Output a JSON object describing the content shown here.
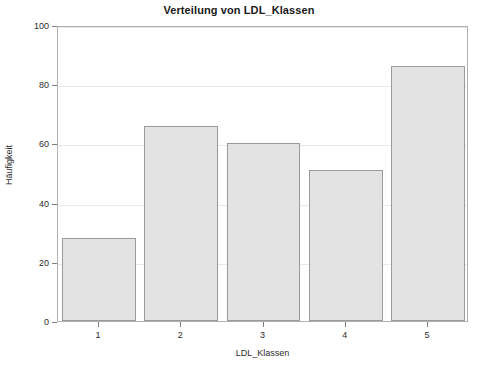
{
  "chart_data": {
    "type": "bar",
    "title": "Verteilung von LDL_Klassen",
    "xlabel": "LDL_Klassen",
    "ylabel": "Häufigkeit",
    "categories": [
      "1",
      "2",
      "3",
      "4",
      "5"
    ],
    "values": [
      28,
      66,
      60,
      51,
      86
    ],
    "ylim": [
      0,
      100
    ],
    "yticks": [
      0,
      20,
      40,
      60,
      80,
      100
    ],
    "ytick_labels": [
      "0",
      "20",
      "40",
      "60",
      "80",
      "100"
    ],
    "grid": "horizontal",
    "legend": null,
    "colors": {
      "bar_fill": "#e3e3e3",
      "bar_border": "#9a9a9a",
      "gridline": "#e8e8e8",
      "frame": "#b0b0b0",
      "text": "#2b2b2b",
      "title_text": "#1a1a1a",
      "background": "#ffffff"
    }
  }
}
